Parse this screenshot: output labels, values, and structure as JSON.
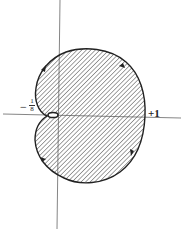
{
  "figure": {
    "labels": {
      "negative_intercept_sign": "−",
      "negative_intercept_numerator": "1",
      "negative_intercept_denominator": "8",
      "positive_intercept": "+1"
    },
    "colors": {
      "curve": "#222222",
      "axis": "#555555",
      "hatch": "#555555",
      "background": "#ffffff"
    },
    "arrows": [
      {
        "position": "upper-left",
        "direction": "up-right"
      },
      {
        "position": "upper-right",
        "direction": "down-right"
      },
      {
        "position": "lower-right",
        "direction": "down-left"
      },
      {
        "position": "lower-left",
        "direction": "up-left"
      }
    ]
  }
}
